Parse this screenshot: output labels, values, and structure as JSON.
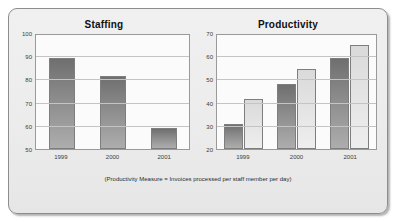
{
  "figure": {
    "caption": "(Productivity Measure = Invoices processed per staff member per day)",
    "background_color": "#ececec",
    "frame_border_color": "#8d8d8d",
    "bar_dark_color": "#8c8c8c",
    "bar_light_color": "#e4e4e4",
    "gridline_color": "#c4c4c4"
  },
  "chart_data": [
    {
      "type": "bar",
      "title": "Staffing",
      "categories": [
        "1999",
        "2000",
        "2001"
      ],
      "values": [
        90,
        82,
        59
      ],
      "series": [
        {
          "name": "Staffing",
          "values": [
            90,
            82,
            59
          ],
          "color": "#8c8c8c"
        }
      ],
      "xlabel": "",
      "ylabel": "",
      "ylim": [
        50,
        100
      ],
      "yticks": [
        50,
        60,
        70,
        80,
        90,
        100
      ],
      "grid": true,
      "legend": "none"
    },
    {
      "type": "bar",
      "title": "Productivity",
      "categories": [
        "1999",
        "2000",
        "2001"
      ],
      "series": [
        {
          "name": "Series 1",
          "values": [
            31,
            48.5,
            60
          ],
          "color": "#8c8c8c"
        },
        {
          "name": "Series 2",
          "values": [
            42,
            55,
            65.5
          ],
          "color": "#e4e4e4"
        }
      ],
      "xlabel": "",
      "ylabel": "",
      "ylim": [
        20,
        70
      ],
      "yticks": [
        20,
        30,
        40,
        50,
        60,
        70
      ],
      "grid": true,
      "legend": "none"
    }
  ]
}
